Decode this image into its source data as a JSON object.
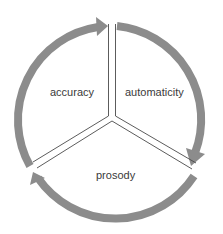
{
  "diagram": {
    "type": "cycle",
    "segments": [
      {
        "id": "accuracy",
        "label": "accuracy"
      },
      {
        "id": "automaticity",
        "label": "automaticity"
      },
      {
        "id": "prosody",
        "label": "prosody"
      }
    ],
    "arrow_direction": "clockwise",
    "colors": {
      "ring": "#8c8c8c",
      "divider": "#4a4a4a",
      "text": "#3a3a3a",
      "background": "#ffffff"
    }
  }
}
